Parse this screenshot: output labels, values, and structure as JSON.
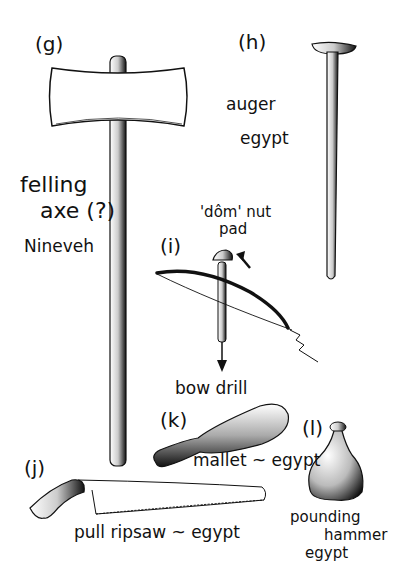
{
  "plate": {
    "items": [
      {
        "id": "g",
        "letter": "(g)",
        "name": "felling",
        "name2": "axe (?)",
        "origin": "Nineveh"
      },
      {
        "id": "h",
        "letter": "(h)",
        "name": "auger",
        "origin": "egypt"
      },
      {
        "id": "i",
        "letter": "(i)",
        "name": "bow drill",
        "annotation1": "'dôm' nut",
        "annotation2": "pad"
      },
      {
        "id": "j",
        "letter": "(j)",
        "name": "pull ripsaw ~ egypt"
      },
      {
        "id": "k",
        "letter": "(k)",
        "name": "mallet ~ egypt"
      },
      {
        "id": "l",
        "letter": "(l)",
        "name": "pounding",
        "name2": "hammer",
        "origin": "egypt"
      }
    ]
  },
  "colors": {
    "ink": "#111111",
    "paper": "#ffffff"
  }
}
